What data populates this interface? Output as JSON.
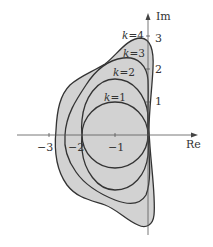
{
  "diagram": {
    "axes": {
      "x_label": "Re",
      "y_label": "Im",
      "x_ticks": [
        {
          "value": -3,
          "label": "−3"
        },
        {
          "value": -2,
          "label": "−2"
        },
        {
          "value": -1,
          "label": "−1"
        }
      ],
      "y_ticks": [
        {
          "value": 1,
          "label": "1"
        },
        {
          "value": 2,
          "label": "2"
        },
        {
          "value": 3,
          "label": "3"
        }
      ]
    },
    "curves": [
      {
        "k": 1,
        "label": "k=1",
        "label_var": "k",
        "label_val": "=1"
      },
      {
        "k": 2,
        "label": "k=2",
        "label_var": "k",
        "label_val": "=2"
      },
      {
        "k": 3,
        "label": "k=3",
        "label_var": "k",
        "label_val": "=3"
      },
      {
        "k": 4,
        "label": "k=4",
        "label_var": "k",
        "label_val": "=4"
      }
    ],
    "colors": {
      "fill": "#d2d2d2",
      "stroke": "#333333",
      "axis": "#555555",
      "background": "#ffffff"
    }
  }
}
